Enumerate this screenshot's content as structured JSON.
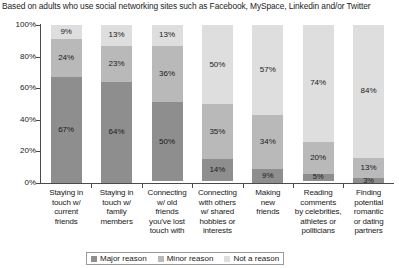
{
  "header": {
    "note": "Based on adults who use social networking sites such as Facebook, MySpace, Linkedin and/or Twitter"
  },
  "legend": {
    "items": [
      {
        "label": "Major reason",
        "color": "#8e8e8e"
      },
      {
        "label": "Minor reason",
        "color": "#b9b9b9"
      },
      {
        "label": "Not a reason",
        "color": "#dedede"
      }
    ]
  },
  "chart_data": {
    "type": "bar",
    "stacked": true,
    "title": "Based on adults who use social networking sites such as Facebook, MySpace, Linkedin and/or Twitter",
    "xlabel": "",
    "ylabel": "",
    "ylim": [
      0,
      100
    ],
    "yticks": [
      "0%",
      "20%",
      "40%",
      "60%",
      "80%",
      "100%"
    ],
    "ytick_values": [
      0,
      20,
      40,
      60,
      80,
      100
    ],
    "grid": false,
    "legend_position": "bottom",
    "categories": [
      "Staying in touch w/ current friends",
      "Staying in touch w/ family members",
      "Connecting w/ old friends you've lost touch with",
      "Connecting with others w/ shared hobbies or interests",
      "Making new friends",
      "Reading comments by celebrities, athletes or politicians",
      "Finding potential romantic or dating partners"
    ],
    "category_lines": [
      [
        "Staying in",
        "touch w/",
        "current",
        "friends"
      ],
      [
        "Staying in",
        "touch w/",
        "family",
        "members"
      ],
      [
        "Connecting",
        "w/ old",
        "friends",
        "you've lost",
        "touch with"
      ],
      [
        "Connecting",
        "with others",
        "w/ shared",
        "hobbies or",
        "interests"
      ],
      [
        "Making",
        "new",
        "friends"
      ],
      [
        "Reading",
        "comments",
        "by celebrities,",
        "athletes or",
        "politicians"
      ],
      [
        "Finding",
        "potential",
        "romantic",
        "or dating",
        "partners"
      ]
    ],
    "series": [
      {
        "name": "Major reason",
        "color": "#8e8e8e",
        "values": [
          67,
          64,
          50,
          14,
          9,
          5,
          3
        ],
        "labels": [
          "67%",
          "64%",
          "50%",
          "14%",
          "9%",
          "5%",
          "3%"
        ]
      },
      {
        "name": "Minor reason",
        "color": "#b9b9b9",
        "values": [
          24,
          23,
          36,
          35,
          34,
          20,
          13
        ],
        "labels": [
          "24%",
          "23%",
          "36%",
          "35%",
          "34%",
          "20%",
          "13%"
        ]
      },
      {
        "name": "Not a reason",
        "color": "#dedede",
        "values": [
          9,
          13,
          13,
          50,
          57,
          74,
          84
        ],
        "labels": [
          "9%",
          "13%",
          "13%",
          "50%",
          "57%",
          "74%",
          "84%"
        ]
      }
    ]
  }
}
